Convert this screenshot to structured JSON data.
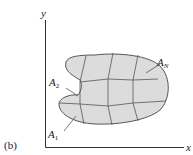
{
  "figure": {
    "panel_label": "(b)",
    "axes": {
      "x_label": "x",
      "y_label": "y"
    },
    "region": {
      "fill_color": "#dcdcdc",
      "edge_color": "#555555"
    },
    "subregion_labels": [
      {
        "base": "A",
        "sub": "1"
      },
      {
        "base": "A",
        "sub": "2"
      },
      {
        "base": "A",
        "sub": "N"
      }
    ]
  }
}
